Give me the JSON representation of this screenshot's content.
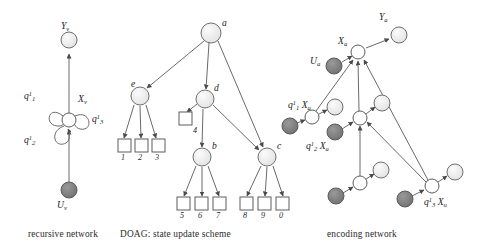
{
  "figure": {
    "title_captions": [
      {
        "id": "cap-recursive",
        "text": "recursive network",
        "x": 28,
        "y": 228
      },
      {
        "id": "cap-doag",
        "text": "DOAG: state update scheme",
        "x": 120,
        "y": 228
      },
      {
        "id": "cap-encoding",
        "text": "encoding network",
        "x": 327,
        "y": 228
      }
    ],
    "colors": {
      "stroke": "#555555",
      "node_light": "#efefef",
      "node_white": "#ffffff",
      "node_dark": "#7b7b7b",
      "text": "#1d1d1d",
      "background": "#ffffff"
    }
  },
  "panels": {
    "recursive_network": {
      "caption": "recursive network",
      "labels": [
        {
          "name": "label-Yv",
          "base": "Y",
          "sub": "v",
          "sup": "",
          "x": 61,
          "y": 26
        },
        {
          "name": "label-Xv",
          "base": "X",
          "sub": "v",
          "sup": "",
          "x": 78,
          "y": 99
        },
        {
          "name": "label-q1",
          "base": "q",
          "sub": "1",
          "sup": "1",
          "x": 25,
          "y": 96
        },
        {
          "name": "label-q2",
          "base": "q",
          "sub": "2",
          "sup": "1",
          "x": 25,
          "y": 140
        },
        {
          "name": "label-q3",
          "base": "q",
          "sub": "3",
          "sup": "1",
          "x": 93,
          "y": 119
        },
        {
          "name": "label-Uv",
          "base": "U",
          "sub": "v",
          "sup": "",
          "x": 57,
          "y": 204
        }
      ],
      "nodes": [
        {
          "name": "node-Yv",
          "kind": "light",
          "cx": 69,
          "cy": 40,
          "r": 8
        },
        {
          "name": "node-Xv",
          "kind": "white",
          "cx": 69,
          "cy": 120,
          "r": 7
        },
        {
          "name": "node-Uv",
          "kind": "dark",
          "cx": 69,
          "cy": 190,
          "r": 8
        }
      ],
      "self_loops": 3
    },
    "doag": {
      "caption": "DOAG: state update scheme",
      "node_labels": [
        {
          "name": "label-a",
          "text": "a",
          "x": 221,
          "y": 22
        },
        {
          "name": "label-e",
          "text": "e",
          "x": 132,
          "y": 83
        },
        {
          "name": "label-d",
          "text": "d",
          "x": 215,
          "y": 87
        },
        {
          "name": "label-b",
          "text": "b",
          "x": 212,
          "y": 145
        },
        {
          "name": "label-c",
          "text": "c",
          "x": 276,
          "y": 145
        }
      ],
      "circle_nodes": [
        {
          "name": "node-a",
          "cx": 211,
          "cy": 33,
          "r": 10
        },
        {
          "name": "node-e",
          "cx": 140,
          "cy": 96,
          "r": 9
        },
        {
          "name": "node-d",
          "cx": 205,
          "cy": 99,
          "r": 9
        },
        {
          "name": "node-b",
          "cx": 202,
          "cy": 157,
          "r": 9
        },
        {
          "name": "node-c",
          "cx": 267,
          "cy": 157,
          "r": 9
        }
      ],
      "leaf_boxes": [
        {
          "name": "leaf-box-1",
          "label": "1",
          "x": 118,
          "y": 141
        },
        {
          "name": "leaf-box-2",
          "label": "2",
          "x": 135,
          "y": 141
        },
        {
          "name": "leaf-box-3",
          "label": "3",
          "x": 152,
          "y": 141
        },
        {
          "name": "leaf-box-4",
          "label": "4",
          "x": 177,
          "y": 113
        },
        {
          "name": "leaf-box-5",
          "label": "5",
          "x": 177,
          "y": 199
        },
        {
          "name": "leaf-box-6",
          "label": "6",
          "x": 195,
          "y": 199
        },
        {
          "name": "leaf-box-7",
          "label": "7",
          "x": 213,
          "y": 199
        },
        {
          "name": "leaf-box-8",
          "label": "8",
          "x": 240,
          "y": 199
        },
        {
          "name": "leaf-box-9",
          "label": "9",
          "x": 258,
          "y": 199
        },
        {
          "name": "leaf-box-0",
          "label": "0",
          "x": 276,
          "y": 199
        }
      ],
      "leaf_numbers": [
        "1",
        "2",
        "3",
        "4",
        "5",
        "6",
        "7",
        "8",
        "9",
        "0"
      ]
    },
    "encoding_network": {
      "caption": "encoding network",
      "labels": [
        {
          "name": "label-Ya",
          "base": "Y",
          "sub": "a",
          "sup": "",
          "x": 378,
          "y": 16
        },
        {
          "name": "label-Xa-top",
          "base": "X",
          "sub": "a",
          "sup": "",
          "x": 338,
          "y": 41
        },
        {
          "name": "label-Ua",
          "base": "U",
          "sub": "a",
          "sup": "",
          "x": 313,
          "y": 60
        },
        {
          "name": "label-q1Xa",
          "base": "q",
          "sub": "1",
          "sup": "1",
          "second": "X",
          "second_sub": "a",
          "x": 289,
          "y": 104
        },
        {
          "name": "label-q2Xa",
          "base": "q",
          "sub": "2",
          "sup": "1",
          "second": "X",
          "second_sub": "a",
          "x": 307,
          "y": 145
        },
        {
          "name": "label-q3Xu",
          "base": "q",
          "sub": "3",
          "sup": "1",
          "second": "X",
          "second_sub": "u",
          "x": 427,
          "y": 200
        }
      ],
      "nodes": [
        {
          "name": "node-Ya",
          "kind": "light",
          "cx": 399,
          "cy": 35,
          "r": 8
        },
        {
          "name": "node-Xa-center",
          "kind": "white",
          "cx": 358,
          "cy": 52,
          "r": 7
        },
        {
          "name": "node-Ua",
          "kind": "dark",
          "cx": 334,
          "cy": 66,
          "r": 8
        },
        {
          "name": "node-q1-state",
          "kind": "white",
          "cx": 312,
          "cy": 117,
          "r": 7
        },
        {
          "name": "node-q1-out",
          "kind": "light",
          "cx": 335,
          "cy": 107,
          "r": 8
        },
        {
          "name": "node-q1-in",
          "kind": "dark",
          "cx": 290,
          "cy": 126,
          "r": 8
        },
        {
          "name": "node-q2-state",
          "kind": "white",
          "cx": 360,
          "cy": 118,
          "r": 7
        },
        {
          "name": "node-q2-out",
          "kind": "light",
          "cx": 382,
          "cy": 103,
          "r": 8
        },
        {
          "name": "node-q2-in",
          "kind": "dark",
          "cx": 335,
          "cy": 132,
          "r": 8
        },
        {
          "name": "node-mid-state",
          "kind": "white",
          "cx": 360,
          "cy": 183,
          "r": 7
        },
        {
          "name": "node-mid-out",
          "kind": "light",
          "cx": 381,
          "cy": 170,
          "r": 8
        },
        {
          "name": "node-mid-in",
          "kind": "dark",
          "cx": 336,
          "cy": 196,
          "r": 8
        },
        {
          "name": "node-q3-state",
          "kind": "white",
          "cx": 432,
          "cy": 186,
          "r": 7
        },
        {
          "name": "node-q3-out",
          "kind": "light",
          "cx": 455,
          "cy": 172,
          "r": 8
        },
        {
          "name": "node-q3-in",
          "kind": "dark",
          "cx": 405,
          "cy": 199,
          "r": 8
        }
      ]
    }
  }
}
